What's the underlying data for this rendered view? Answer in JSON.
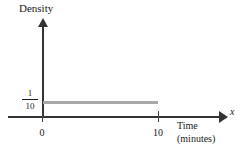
{
  "chart_data": {
    "type": "line",
    "title": "",
    "subtitle": "",
    "xlabel": "Time (minutes)",
    "ylabel": "Density",
    "x_variable": "x",
    "xlim": [
      0,
      10
    ],
    "ylim": [
      0,
      0.28
    ],
    "grid": false,
    "legend": null,
    "x_ticks": [
      "0",
      "10"
    ],
    "x_tick_values": [
      0,
      10
    ],
    "y_ticks": [
      "1/10"
    ],
    "y_tick_values": [
      0.1
    ],
    "series": [
      {
        "name": "Uniform density",
        "kind": "horizontal-segment",
        "x": [
          0,
          10
        ],
        "values": [
          0.1,
          0.1
        ],
        "color": "#a8a8a8"
      }
    ],
    "annotations": []
  },
  "axes": {
    "y_title": "Density",
    "x_variable": "x",
    "x_title_line1": "Time",
    "x_title_line2": "(minutes)",
    "y_value_numerator": "1",
    "y_value_denominator": "10",
    "x_tick_zero": "0",
    "x_tick_ten": "10"
  },
  "colors": {
    "axis": "#333333",
    "density": "#a8a8a8",
    "text": "#1a1a1a",
    "background": "#ffffff"
  }
}
